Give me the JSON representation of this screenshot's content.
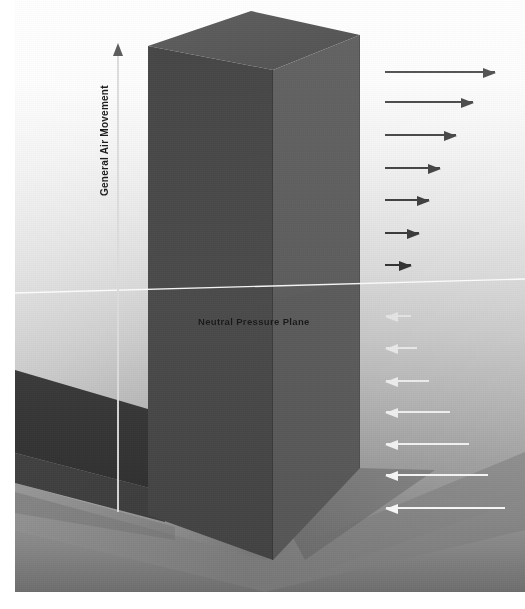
{
  "diagram": {
    "labels": {
      "neutral_pressure_plane": "Neutral Pressure Plane",
      "general_air_movement": "General Air Movement"
    },
    "colors": {
      "building_front": "#4a4a4a",
      "building_side": "#606060",
      "building_top": "#5a5a5a",
      "ground": "#8f8f8f",
      "shadow_band": "#3a3a3a",
      "npp_line": "#ffffff",
      "infiltration_arrow": "#3c3c3c",
      "exfiltration_arrow": "#f2f2f2",
      "vertical_arrow": "#dcdcdc",
      "background_top": "#ffffff",
      "background_bottom": "#6f6f6f"
    },
    "vertical_arrow": {
      "name": "general-air-movement-arrow",
      "direction": "up",
      "x": 103,
      "tip_y": 55,
      "tail_y": 512
    },
    "npp": {
      "left_y": 293,
      "right_y": 280
    },
    "inflow_arrows": [
      {
        "y": 72,
        "x_tail": 370,
        "x_head": 480,
        "length": 110,
        "color": "#555555",
        "direction": "right"
      },
      {
        "y": 102,
        "x_tail": 370,
        "x_head": 458,
        "length": 88,
        "color": "#4e4e4e",
        "direction": "right"
      },
      {
        "y": 135,
        "x_tail": 370,
        "x_head": 441,
        "length": 71,
        "color": "#4a4a4a",
        "direction": "right"
      },
      {
        "y": 168,
        "x_tail": 370,
        "x_head": 425,
        "length": 55,
        "color": "#464646",
        "direction": "right"
      },
      {
        "y": 200,
        "x_tail": 370,
        "x_head": 414,
        "length": 44,
        "color": "#414141",
        "direction": "right"
      },
      {
        "y": 233,
        "x_tail": 370,
        "x_head": 404,
        "length": 34,
        "color": "#3b3b3b",
        "direction": "right"
      },
      {
        "y": 265,
        "x_tail": 370,
        "x_head": 396,
        "length": 26,
        "color": "#333333",
        "direction": "right"
      }
    ],
    "outflow_arrows": [
      {
        "y": 316,
        "x_head": 371,
        "x_tail": 396,
        "length": 25,
        "color": "#e4e4e4",
        "direction": "left"
      },
      {
        "y": 348,
        "x_head": 371,
        "x_tail": 402,
        "length": 31,
        "color": "#e8e8e8",
        "direction": "left"
      },
      {
        "y": 381,
        "x_head": 371,
        "x_tail": 414,
        "length": 43,
        "color": "#ececec",
        "direction": "left"
      },
      {
        "y": 412,
        "x_head": 371,
        "x_tail": 435,
        "length": 64,
        "color": "#efefef",
        "direction": "left"
      },
      {
        "y": 444,
        "x_head": 371,
        "x_tail": 454,
        "length": 83,
        "color": "#f2f2f2",
        "direction": "left"
      },
      {
        "y": 475,
        "x_head": 371,
        "x_tail": 473,
        "length": 102,
        "color": "#f5f5f5",
        "direction": "left"
      },
      {
        "y": 508,
        "x_head": 371,
        "x_tail": 490,
        "length": 119,
        "color": "#f7f7f7",
        "direction": "left"
      }
    ]
  }
}
